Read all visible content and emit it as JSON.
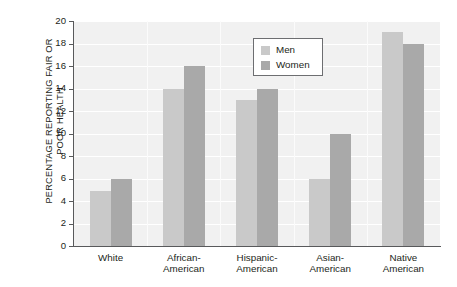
{
  "chart_data": {
    "type": "bar",
    "title": "",
    "subtitle": "",
    "xlabel": "",
    "ylabel": "PERCENTAGE REPORTING FAIR OR POOR HEALTH",
    "ylabel_lines": [
      "PERCENTAGE REPORTING FAIR OR",
      "POOR HEALTH"
    ],
    "categories": [
      "White",
      "African-American",
      "Hispanic-American",
      "Asian-American",
      "Native American"
    ],
    "category_lines": [
      [
        "White"
      ],
      [
        "African-",
        "American"
      ],
      [
        "Hispanic-",
        "American"
      ],
      [
        "Asian-",
        "American"
      ],
      [
        "Native",
        "American"
      ]
    ],
    "series": [
      {
        "name": "Men",
        "values": [
          4.9,
          14,
          13,
          6,
          19
        ],
        "color": "#c9c9c9"
      },
      {
        "name": "Women",
        "values": [
          6,
          16,
          14,
          10,
          18
        ],
        "color": "#a9a9a9"
      }
    ],
    "ylim": [
      0,
      20
    ],
    "ytick_values": [
      0,
      2,
      4,
      6,
      8,
      10,
      12,
      14,
      16,
      18,
      20
    ],
    "ytick_labels": [
      "0",
      "2",
      "4",
      "6",
      "8",
      "10",
      "12",
      "14",
      "16",
      "18",
      "20"
    ],
    "grid": {
      "horizontal": true,
      "vertical": true,
      "color": "#ffffff"
    },
    "plot_background": "#f1f1f1",
    "axis_color": "#58595b",
    "legend": {
      "position": "top-center",
      "entries": [
        {
          "label": "Men",
          "color": "#c9c9c9"
        },
        {
          "label": "Women",
          "color": "#a9a9a9"
        }
      ]
    }
  }
}
